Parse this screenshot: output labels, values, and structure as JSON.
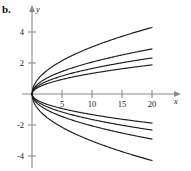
{
  "figure": {
    "panel_label": "b.",
    "axis_x_label": "x",
    "axis_y_label": "y"
  },
  "ticks": {
    "x": [
      "5",
      "10",
      "15",
      "20"
    ],
    "y": [
      "4",
      "2",
      "-2",
      "-4"
    ]
  },
  "chart_data": {
    "type": "line",
    "title": "",
    "subtitle": "",
    "xlabel": "x",
    "ylabel": "y",
    "xlim": [
      -1.2,
      23.5
    ],
    "ylim": [
      -5.3,
      5.3
    ],
    "xticks": [
      5,
      10,
      15,
      20
    ],
    "yticks": [
      4,
      2,
      -2,
      -4
    ],
    "grid": false,
    "legend": false,
    "axes_style": "centered-arrow",
    "series": [
      {
        "name": "c = 0.96 (upper)",
        "formula": "y = c*sqrt(x)",
        "coefficient": 0.96,
        "x": [
          0,
          1,
          2,
          3,
          5,
          7.5,
          10,
          12.5,
          15,
          17.5,
          20
        ],
        "values": [
          0,
          0.96,
          1.36,
          1.66,
          2.15,
          2.63,
          3.04,
          3.39,
          3.72,
          4.02,
          4.29
        ]
      },
      {
        "name": "c = 0.65 (upper)",
        "formula": "y = c*sqrt(x)",
        "coefficient": 0.65,
        "x": [
          0,
          1,
          2,
          3,
          5,
          7.5,
          10,
          12.5,
          15,
          17.5,
          20
        ],
        "values": [
          0,
          0.65,
          0.92,
          1.13,
          1.45,
          1.78,
          2.06,
          2.3,
          2.52,
          2.72,
          2.91
        ]
      },
      {
        "name": "c = 0.52 (upper)",
        "formula": "y = c*sqrt(x)",
        "coefficient": 0.52,
        "x": [
          0,
          1,
          2,
          3,
          5,
          7.5,
          10,
          12.5,
          15,
          17.5,
          20
        ],
        "values": [
          0,
          0.52,
          0.74,
          0.9,
          1.16,
          1.42,
          1.64,
          1.84,
          2.01,
          2.18,
          2.33
        ]
      },
      {
        "name": "c = 0.42 (upper)",
        "formula": "y = c*sqrt(x)",
        "coefficient": 0.42,
        "x": [
          0,
          1,
          2,
          3,
          5,
          7.5,
          10,
          12.5,
          15,
          17.5,
          20
        ],
        "values": [
          0,
          0.42,
          0.59,
          0.73,
          0.94,
          1.15,
          1.33,
          1.48,
          1.63,
          1.76,
          1.88
        ]
      },
      {
        "name": "c = -0.42 (lower)",
        "formula": "y = c*sqrt(x)",
        "coefficient": -0.42,
        "x": [
          0,
          1,
          2,
          3,
          5,
          7.5,
          10,
          12.5,
          15,
          17.5,
          20
        ],
        "values": [
          0,
          -0.42,
          -0.59,
          -0.73,
          -0.94,
          -1.15,
          -1.33,
          -1.48,
          -1.63,
          -1.76,
          -1.88
        ]
      },
      {
        "name": "c = -0.52 (lower)",
        "formula": "y = c*sqrt(x)",
        "coefficient": -0.52,
        "x": [
          0,
          1,
          2,
          3,
          5,
          7.5,
          10,
          12.5,
          15,
          17.5,
          20
        ],
        "values": [
          0,
          -0.52,
          -0.74,
          -0.9,
          -1.16,
          -1.42,
          -1.64,
          -1.84,
          -2.01,
          -2.18,
          -2.33
        ]
      },
      {
        "name": "c = -0.65 (lower)",
        "formula": "y = c*sqrt(x)",
        "coefficient": -0.65,
        "x": [
          0,
          1,
          2,
          3,
          5,
          7.5,
          10,
          12.5,
          15,
          17.5,
          20
        ],
        "values": [
          0,
          -0.65,
          -0.92,
          -1.13,
          -1.45,
          -1.78,
          -2.06,
          -2.3,
          -2.52,
          -2.72,
          -2.91
        ]
      },
      {
        "name": "c = -0.96 (lower)",
        "formula": "y = c*sqrt(x)",
        "coefficient": -0.96,
        "x": [
          0,
          1,
          2,
          3,
          5,
          7.5,
          10,
          12.5,
          15,
          17.5,
          20
        ],
        "values": [
          0,
          -0.96,
          -1.36,
          -1.66,
          -2.15,
          -2.63,
          -3.04,
          -3.39,
          -3.72,
          -4.02,
          -4.29
        ]
      }
    ],
    "colors": {
      "curve": "#1c1c1c",
      "axis": "#8a8a8a",
      "text": "#1a1a1a",
      "background": "#ffffff"
    }
  }
}
